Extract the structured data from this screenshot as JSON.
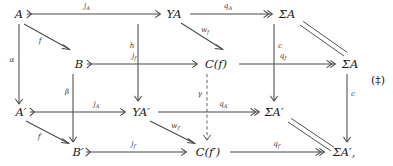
{
  "figure": {
    "tag": "(‡)",
    "kind": "commutative-diagram",
    "background": "#ffffff",
    "ink": "#3f3f3f"
  },
  "nodes": {
    "A": {
      "label": "A"
    },
    "YA": {
      "label": "YA"
    },
    "SigmaA": {
      "label": "ΣA"
    },
    "B": {
      "label": "B"
    },
    "Cf": {
      "label": "C(f)"
    },
    "SigmaA2": {
      "label": "ΣA"
    },
    "Aprime": {
      "label": "A′"
    },
    "YAprime": {
      "label": "YA′"
    },
    "SigmaAprime": {
      "label": "ΣA′"
    },
    "Bprime": {
      "label": "B′"
    },
    "Cfprime": {
      "label": "C(f′)"
    },
    "SigmaAprime2": {
      "label": "ΣA′,"
    }
  },
  "arrows": {
    "jA": {
      "label_base": "j",
      "label_sub": "A",
      "style": "mono"
    },
    "qA": {
      "label_base": "q",
      "label_sub": "A",
      "style": "epi"
    },
    "f": {
      "label_base": "f",
      "label_sub": "",
      "style": "plain"
    },
    "alpha": {
      "label_base": "α",
      "label_sub": "",
      "style": "plain"
    },
    "h": {
      "label_base": "h",
      "label_sub": "",
      "style": "plain"
    },
    "wf": {
      "label_base": "w",
      "label_sub": "f",
      "style": "plain"
    },
    "c_top": {
      "label_base": "c",
      "label_sub": "",
      "style": "plain"
    },
    "eq_top": {
      "label_base": "",
      "label_sub": "",
      "style": "equality"
    },
    "jf": {
      "label_base": "j",
      "label_sub": "f",
      "style": "mono"
    },
    "qf": {
      "label_base": "q",
      "label_sub": "f",
      "style": "epi"
    },
    "beta": {
      "label_base": "β",
      "label_sub": "",
      "style": "plain"
    },
    "gamma": {
      "label_base": "γ",
      "label_sub": "",
      "style": "dashed"
    },
    "c_right": {
      "label_base": "c",
      "label_sub": "",
      "style": "plain"
    },
    "jAprime": {
      "label_base": "j",
      "label_sub": "A′",
      "style": "mono"
    },
    "qAprime": {
      "label_base": "q",
      "label_sub": "A′",
      "style": "epi"
    },
    "fprime": {
      "label_base": "f′",
      "label_sub": "",
      "style": "plain"
    },
    "wfprime": {
      "label_base": "w",
      "label_sub": "f′",
      "style": "plain"
    },
    "jfprime": {
      "label_base": "j",
      "label_sub": "f′",
      "style": "mono"
    },
    "qfprime": {
      "label_base": "q",
      "label_sub": "f′",
      "style": "epi"
    },
    "eq_bottom": {
      "label_base": "",
      "label_sub": "",
      "style": "equality"
    }
  }
}
